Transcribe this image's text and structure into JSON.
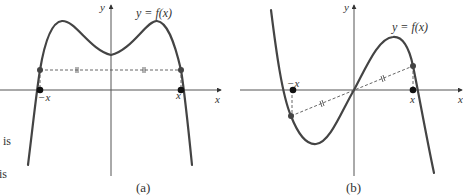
{
  "figure": {
    "panels": [
      {
        "id": "a",
        "caption": "(a)",
        "curve_label": "y = f(x)",
        "axis_x_label": "x",
        "axis_y_label": "y",
        "point_left_label": "−x",
        "point_right_label": "x",
        "description": "Even function symmetric about the y-axis; f(−x) = f(x)"
      },
      {
        "id": "b",
        "caption": "(b)",
        "curve_label": "y = f(x)",
        "axis_x_label": "x",
        "axis_y_label": "y",
        "point_left_label": "−x",
        "point_right_label": "x",
        "description": "Odd function symmetric about the origin; f(−x) = −f(x)"
      }
    ],
    "margin_text": [
      "is",
      "is"
    ]
  }
}
